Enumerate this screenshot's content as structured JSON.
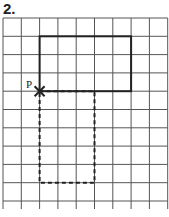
{
  "problem": {
    "number": "2."
  },
  "diagram": {
    "grid": {
      "cols": 9,
      "rows": 10,
      "origin_x": 3,
      "origin_y": 18,
      "cell": 18.3,
      "line_color": "#555555"
    },
    "point": {
      "label": "P",
      "col": 2,
      "row": 4
    },
    "solid_rectangle": {
      "col": 2,
      "row": 1,
      "width": 5,
      "height": 3,
      "style": "solid"
    },
    "dashed_rectangle": {
      "col": 2,
      "row": 4,
      "width": 3,
      "height": 5,
      "style": "dashed"
    }
  }
}
